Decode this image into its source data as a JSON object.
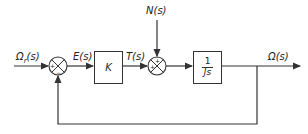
{
  "diagram": {
    "type": "feedback-control-block-diagram",
    "signals": {
      "input": "Ωr(s)",
      "input_main": "Ω",
      "input_sub": "r",
      "input_arg": "(s)",
      "error": "E(s)",
      "torque": "T(s)",
      "disturbance": "N(s)",
      "output": "Ω(s)"
    },
    "blocks": {
      "controller": "K",
      "plant_num": "1",
      "plant_den": "Js"
    },
    "junctions": {
      "error_sum": {
        "in_sign": "+",
        "feedback_sign": "−"
      },
      "disturbance_sum": {
        "in_sign": "+",
        "disturbance_sign": "+"
      }
    },
    "colors": {
      "line": "#333333",
      "background": "#ffffff"
    }
  }
}
